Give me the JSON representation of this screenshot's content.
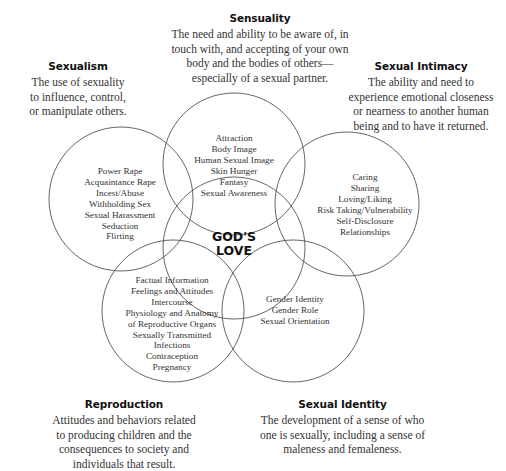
{
  "diagram": {
    "center": {
      "line1": "GOD'S",
      "line2": "LOVE"
    },
    "definitions": {
      "sensuality": {
        "title": "Sensuality",
        "lines": [
          "The need and ability to be aware of, in",
          "touch with, and accepting of your own",
          "body and the bodies of others—",
          "especially of a sexual partner."
        ]
      },
      "sexualism": {
        "title": "Sexualism",
        "lines": [
          "The use of sexuality",
          "to influence, control,",
          "or manipulate others."
        ]
      },
      "sexual_intimacy": {
        "title": "Sexual Intimacy",
        "lines": [
          "The ability and need to",
          "experience emotional closeness",
          "or nearness to another human",
          "being and to have it returned."
        ]
      },
      "reproduction": {
        "title": "Reproduction",
        "lines": [
          "Attitudes and behaviors related",
          "to producing children and the",
          "consequences to society and",
          "individuals that result."
        ]
      },
      "sexual_identity": {
        "title": "Sexual Identity",
        "lines": [
          "The development of a sense of who",
          "one is sexually, including a sense of",
          "maleness and femaleness."
        ]
      }
    },
    "circles": {
      "sensuality": [
        "Attraction",
        "Body Image",
        "Human Sexual Image",
        "Skin Hunger",
        "Fantasy",
        "Sexual Awareness"
      ],
      "sexualism": [
        "Power Rape",
        "Acquaintance Rape",
        "Incest/Abuse",
        "Withholding Sex",
        "Sexual Harassment",
        "Seduction",
        "Flirting"
      ],
      "sexual_intimacy": [
        "Caring",
        "Sharing",
        "Loving/Liking",
        "Risk Taking/Vulnerability",
        "Self-Disclosure",
        "Relationships"
      ],
      "reproduction": [
        "Factual Information",
        "Feelings and Attitudes",
        "Intercourse",
        "Physiology and Anatomy",
        "of Reproductive Organs",
        "Sexually Transmitted",
        "Infections",
        "Contraception",
        "Pregnancy"
      ],
      "sexual_identity": [
        "Gender Identity",
        "Gender Role",
        "Sexual Orientation"
      ]
    },
    "colors": {
      "stroke": "#555555",
      "text": "#333333",
      "title": "#111111"
    }
  }
}
